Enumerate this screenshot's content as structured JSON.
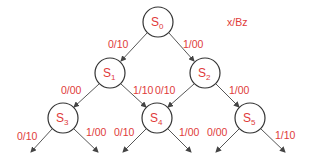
{
  "legend": "x/Bz",
  "colors": {
    "text": "#e03a3a",
    "stroke": "#333333"
  },
  "nodes": [
    {
      "id": "S0",
      "main": "S",
      "sub": "0",
      "cx": 158,
      "cy": 22
    },
    {
      "id": "S1",
      "main": "S",
      "sub": "1",
      "cx": 110,
      "cy": 73
    },
    {
      "id": "S2",
      "main": "S",
      "sub": "2",
      "cx": 205,
      "cy": 73
    },
    {
      "id": "S3",
      "main": "S",
      "sub": "3",
      "cx": 63,
      "cy": 118
    },
    {
      "id": "S4",
      "main": "S",
      "sub": "4",
      "cx": 157,
      "cy": 118
    },
    {
      "id": "S5",
      "main": "S",
      "sub": "5",
      "cx": 250,
      "cy": 118
    }
  ],
  "edges": [
    {
      "from": "S0",
      "to": "S1",
      "label": "0/10"
    },
    {
      "from": "S0",
      "to": "S2",
      "label": "1/00"
    },
    {
      "from": "S1",
      "to": "S3",
      "label": "0/00"
    },
    {
      "from": "S1",
      "to": "S4",
      "label": "1/10"
    },
    {
      "from": "S2",
      "to": "S4",
      "label": "0/10"
    },
    {
      "from": "S2",
      "to": "S5",
      "label": "1/00"
    },
    {
      "from": "S3",
      "to": "out",
      "label": "0/10"
    },
    {
      "from": "S3",
      "to": "out",
      "label": "1/00"
    },
    {
      "from": "S4",
      "to": "out",
      "label": "0/10"
    },
    {
      "from": "S4",
      "to": "out",
      "label": "1/00"
    },
    {
      "from": "S5",
      "to": "out",
      "label": "0/00"
    },
    {
      "from": "S5",
      "to": "out",
      "label": "1/10"
    }
  ]
}
